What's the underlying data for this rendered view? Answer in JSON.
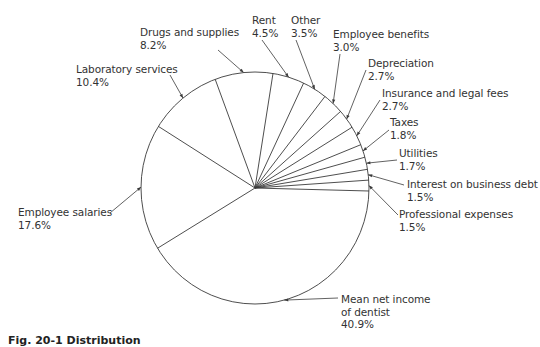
{
  "chart_data": {
    "type": "pie",
    "title": "",
    "caption": "Fig. 20-1 Distribution",
    "unit": "%",
    "start_angle_deg": 0,
    "direction": "counterclockwise",
    "slices": [
      {
        "label": "Professional expenses",
        "value": 1.5
      },
      {
        "label": "Interest on business debt",
        "value": 1.5
      },
      {
        "label": "Utilities",
        "value": 1.7
      },
      {
        "label": "Taxes",
        "value": 1.8
      },
      {
        "label": "Insurance and legal fees",
        "value": 2.7
      },
      {
        "label": "Depreciation",
        "value": 2.7
      },
      {
        "label": "Employee benefits",
        "value": 3.0
      },
      {
        "label": "Other",
        "value": 3.5
      },
      {
        "label": "Rent",
        "value": 4.5
      },
      {
        "label": "Drugs and supplies",
        "value": 8.2
      },
      {
        "label": "Laboratory services",
        "value": 10.4
      },
      {
        "label": "Employee salaries",
        "value": 17.6
      },
      {
        "label": "Mean net income of dentist",
        "value": 40.9
      }
    ],
    "legend": "none (callout labels with leader lines)"
  },
  "labels": [
    {
      "line1": "Drugs and supplies",
      "line2": "8.2%"
    },
    {
      "line1": "Rent",
      "line2": "4.5%"
    },
    {
      "line1": "Other",
      "line2": "3.5%"
    },
    {
      "line1": "Employee benefits",
      "line2": "3.0%"
    },
    {
      "line1": "Depreciation",
      "line2": "2.7%"
    },
    {
      "line1": "Insurance and legal fees",
      "line2": "2.7%"
    },
    {
      "line1": "Taxes",
      "line2": "1.8%"
    },
    {
      "line1": "Utilities",
      "line2": "1.7%"
    },
    {
      "line1": "Interest on business debt",
      "line2": "1.5%"
    },
    {
      "line1": "Professional expenses",
      "line2": "1.5%"
    },
    {
      "line1": "Laboratory services",
      "line2": "10.4%"
    },
    {
      "line1": "Employee salaries",
      "line2": "17.6%"
    },
    {
      "line1": "Mean net income",
      "line2": "of dentist",
      "line3": "40.9%"
    }
  ]
}
